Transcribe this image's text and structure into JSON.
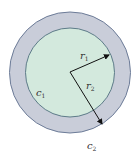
{
  "diagram": {
    "type": "concentric-circles",
    "outer_circle": {
      "cx": 70,
      "cy": 72.5,
      "r": 61,
      "fill": "#c8ccd8",
      "stroke": "#6a7a9a"
    },
    "inner_circle": {
      "cx": 70,
      "cy": 72.5,
      "r": 45,
      "fill": "#d2e9dc",
      "stroke": "#5a7a8a"
    },
    "labels": {
      "r1": {
        "main": "r",
        "sub": "1"
      },
      "r2": {
        "main": "r",
        "sub": "2"
      },
      "c1": {
        "main": "c",
        "sub": "1"
      },
      "c2": {
        "main": "c",
        "sub": "2"
      }
    },
    "arrows": [
      {
        "name": "r1",
        "from": [
          70,
          72
        ],
        "to": [
          109,
          55
        ]
      },
      {
        "name": "r2",
        "from": [
          70,
          72
        ],
        "to": [
          102,
          124
        ]
      }
    ]
  }
}
